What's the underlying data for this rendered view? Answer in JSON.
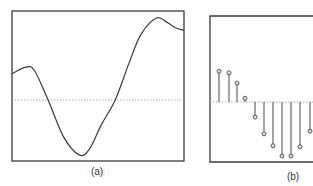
{
  "figure": {
    "panels": [
      {
        "id": "a",
        "caption": "(a)"
      },
      {
        "id": "b",
        "caption": "(b)"
      }
    ]
  },
  "colors": {
    "frame": "#3a3a3a",
    "curve": "#3a3a3a",
    "zero_line": "#9a9a9a",
    "stem": "#4a4a4a",
    "marker_fill": "#dddddd",
    "caption": "#333333"
  },
  "chart_data": [
    {
      "type": "line",
      "title": "",
      "caption": "(a)",
      "description": "Continuous-time signal: smooth oscillating waveform with a dotted zero reference line",
      "xlabel": "",
      "ylabel": "",
      "grid": false,
      "legend": null,
      "x": [
        0,
        0.08,
        0.13,
        0.21,
        0.3,
        0.39,
        0.45,
        0.52,
        0.6,
        0.68,
        0.75,
        0.84,
        0.9,
        0.95,
        1.0
      ],
      "values": [
        0.32,
        0.4,
        0.36,
        0.0,
        -0.45,
        -0.67,
        -0.6,
        -0.3,
        0.0,
        0.45,
        0.8,
        1.0,
        0.95,
        0.88,
        0.85
      ],
      "zero_line": {
        "y": 0,
        "style": "dotted"
      },
      "ylim": [
        -0.75,
        1.1
      ]
    },
    {
      "type": "stem",
      "title": "",
      "caption": "(b)",
      "description": "Discrete-time sampled signal shown as stems with circular markers (panel clipped at right edge)",
      "xlabel": "",
      "ylabel": "",
      "grid": false,
      "legend": null,
      "n": [
        0,
        1,
        2,
        3,
        4,
        5,
        6,
        7,
        8,
        9,
        10
      ],
      "values": [
        0.57,
        0.54,
        0.35,
        0.07,
        -0.28,
        -0.59,
        -0.81,
        -1.0,
        -1.0,
        -0.83,
        -0.54
      ],
      "zero_line": {
        "y": 0,
        "style": "dotted"
      },
      "ylim": [
        -1.1,
        1.6
      ]
    }
  ]
}
